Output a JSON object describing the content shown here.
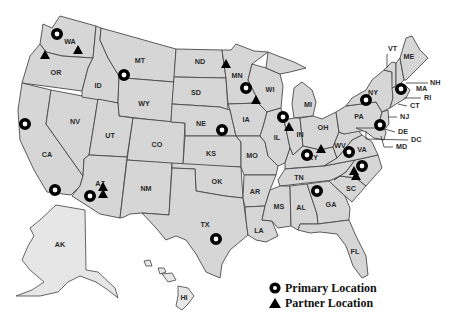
{
  "map": {
    "type": "us-states-locations",
    "fill_color": "#d6d6d6",
    "border_color": "#4a4a4a",
    "marker_color": "#000000",
    "state_labels": [
      {
        "code": "WA",
        "x": 70,
        "y": 42
      },
      {
        "code": "OR",
        "x": 56,
        "y": 73
      },
      {
        "code": "CA",
        "x": 47,
        "y": 155
      },
      {
        "code": "ID",
        "x": 98,
        "y": 86
      },
      {
        "code": "NV",
        "x": 75,
        "y": 122
      },
      {
        "code": "MT",
        "x": 140,
        "y": 61
      },
      {
        "code": "WY",
        "x": 144,
        "y": 104
      },
      {
        "code": "UT",
        "x": 110,
        "y": 136
      },
      {
        "code": "CO",
        "x": 157,
        "y": 145
      },
      {
        "code": "AZ",
        "x": 100,
        "y": 184
      },
      {
        "code": "NM",
        "x": 146,
        "y": 189
      },
      {
        "code": "ND",
        "x": 200,
        "y": 62
      },
      {
        "code": "SD",
        "x": 196,
        "y": 93
      },
      {
        "code": "NE",
        "x": 201,
        "y": 124
      },
      {
        "code": "KS",
        "x": 211,
        "y": 154
      },
      {
        "code": "OK",
        "x": 217,
        "y": 182
      },
      {
        "code": "TX",
        "x": 205,
        "y": 225
      },
      {
        "code": "MN",
        "x": 237,
        "y": 76
      },
      {
        "code": "IA",
        "x": 246,
        "y": 120
      },
      {
        "code": "MO",
        "x": 252,
        "y": 156
      },
      {
        "code": "AR",
        "x": 255,
        "y": 192
      },
      {
        "code": "LA",
        "x": 259,
        "y": 231
      },
      {
        "code": "WI",
        "x": 270,
        "y": 90
      },
      {
        "code": "IL",
        "x": 277,
        "y": 138
      },
      {
        "code": "MI",
        "x": 308,
        "y": 105
      },
      {
        "code": "IN",
        "x": 300,
        "y": 135
      },
      {
        "code": "OH",
        "x": 323,
        "y": 128
      },
      {
        "code": "KY",
        "x": 313,
        "y": 158
      },
      {
        "code": "TN",
        "x": 299,
        "y": 178
      },
      {
        "code": "MS",
        "x": 279,
        "y": 207
      },
      {
        "code": "AL",
        "x": 301,
        "y": 208
      },
      {
        "code": "GA",
        "x": 331,
        "y": 205
      },
      {
        "code": "FL",
        "x": 355,
        "y": 252
      },
      {
        "code": "SC",
        "x": 351,
        "y": 189
      },
      {
        "code": "WV",
        "x": 340,
        "y": 146
      },
      {
        "code": "VA",
        "x": 362,
        "y": 150
      },
      {
        "code": "PA",
        "x": 359,
        "y": 117
      },
      {
        "code": "NY",
        "x": 373,
        "y": 93
      },
      {
        "code": "ME",
        "x": 409,
        "y": 57
      },
      {
        "code": "AK",
        "x": 60,
        "y": 245
      },
      {
        "code": "HI",
        "x": 184,
        "y": 298
      }
    ],
    "outside_labels": [
      {
        "code": "VT",
        "x": 388,
        "y": 49,
        "lx1": 387,
        "ly1": 54,
        "lx2": 387,
        "ly2": 66
      },
      {
        "code": "NH",
        "x": 430,
        "y": 83,
        "lx1": 408,
        "ly1": 83,
        "lx2": 428,
        "ly2": 83
      },
      {
        "code": "MA",
        "x": 416,
        "y": 89,
        "lx1": 0,
        "ly1": 0,
        "lx2": 0,
        "ly2": 0
      },
      {
        "code": "RI",
        "x": 424,
        "y": 98,
        "lx1": 406,
        "ly1": 98,
        "lx2": 421,
        "ly2": 98
      },
      {
        "code": "CT",
        "x": 410,
        "y": 106,
        "lx1": 398,
        "ly1": 104,
        "lx2": 408,
        "ly2": 106
      },
      {
        "code": "NJ",
        "x": 400,
        "y": 117,
        "lx1": 389,
        "ly1": 117,
        "lx2": 397,
        "ly2": 117
      },
      {
        "code": "DE",
        "x": 398,
        "y": 132,
        "lx1": 386,
        "ly1": 128,
        "lx2": 395,
        "ly2": 132
      },
      {
        "code": "DC",
        "x": 411,
        "y": 140,
        "lx1": 366,
        "ly1": 131,
        "lx2": 408,
        "ly2": 140
      },
      {
        "code": "MD",
        "x": 396,
        "y": 147,
        "lx1": 381,
        "ly1": 137,
        "lx2": 393,
        "ly2": 147
      }
    ],
    "primary_locations": [
      {
        "state": "WA",
        "x": 57,
        "y": 34
      },
      {
        "state": "MT",
        "x": 124,
        "y": 75
      },
      {
        "state": "CA",
        "x": 25,
        "y": 124
      },
      {
        "state": "CA",
        "x": 55,
        "y": 190
      },
      {
        "state": "AZ",
        "x": 90,
        "y": 196
      },
      {
        "state": "NE",
        "x": 222,
        "y": 130
      },
      {
        "state": "MN",
        "x": 246,
        "y": 88
      },
      {
        "state": "IL",
        "x": 283,
        "y": 117
      },
      {
        "state": "KY",
        "x": 307,
        "y": 155
      },
      {
        "state": "VA",
        "x": 349,
        "y": 152
      },
      {
        "state": "NC",
        "x": 362,
        "y": 166
      },
      {
        "state": "GA",
        "x": 317,
        "y": 191
      },
      {
        "state": "TX",
        "x": 216,
        "y": 239
      },
      {
        "state": "NY",
        "x": 366,
        "y": 100
      },
      {
        "state": "MA",
        "x": 401,
        "y": 89
      },
      {
        "state": "DE",
        "x": 380,
        "y": 125
      }
    ],
    "partner_locations": [
      {
        "state": "OR",
        "x": 45,
        "y": 55
      },
      {
        "state": "WA",
        "x": 78,
        "y": 50
      },
      {
        "state": "AZ",
        "x": 103,
        "y": 187
      },
      {
        "state": "AZ",
        "x": 103,
        "y": 194
      },
      {
        "state": "MN",
        "x": 226,
        "y": 64
      },
      {
        "state": "WI",
        "x": 256,
        "y": 100
      },
      {
        "state": "IN",
        "x": 289,
        "y": 127
      },
      {
        "state": "KY",
        "x": 321,
        "y": 149
      },
      {
        "state": "NC",
        "x": 354,
        "y": 171
      },
      {
        "state": "NC",
        "x": 356,
        "y": 176
      }
    ]
  },
  "legend": {
    "primary_label": "Primary Location",
    "partner_label": "Partner Location"
  }
}
